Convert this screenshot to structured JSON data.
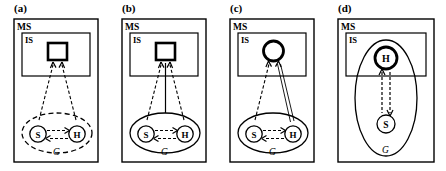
{
  "figure": {
    "width": 446,
    "height": 171,
    "background": "#ffffff",
    "stroke_color": "#000000",
    "panel_count": 4
  },
  "panels": [
    {
      "id": "panel-a",
      "label": "(a)",
      "outer_box_label": "MS",
      "inner_box_label": "IS",
      "group_label": "G",
      "node_left_label": "S",
      "node_right_label": "H",
      "percept_shape": "square",
      "percept_stroke": "thick",
      "group_ellipse_style": "dashed",
      "node_left_circle_style": "thin",
      "node_right_circle_style": "thin",
      "arrow_left_to_percept": "dashed-single",
      "arrow_right_to_percept": "dashed-single",
      "arrow_center_to_percept": "none",
      "arrow_s_to_h": "dashed-single",
      "arrow_h_to_s": "dashed-single"
    },
    {
      "id": "panel-b",
      "label": "(b)",
      "outer_box_label": "MS",
      "inner_box_label": "IS",
      "group_label": "G",
      "node_left_label": "S",
      "node_right_label": "H",
      "percept_shape": "square",
      "percept_stroke": "thick",
      "group_ellipse_style": "solid",
      "node_left_circle_style": "thin",
      "node_right_circle_style": "thin",
      "arrow_left_to_percept": "dashed-single",
      "arrow_right_to_percept": "dashed-single",
      "arrow_center_to_percept": "solid-line",
      "arrow_s_to_h": "dashed-single",
      "arrow_h_to_s": "dashed-single"
    },
    {
      "id": "panel-c",
      "label": "(c)",
      "outer_box_label": "MS",
      "inner_box_label": "IS",
      "group_label": "G",
      "node_left_label": "S",
      "node_right_label": "H",
      "percept_shape": "circle",
      "percept_stroke": "thick",
      "group_ellipse_style": "solid",
      "node_left_circle_style": "thin",
      "node_right_circle_style": "thin",
      "arrow_left_to_percept": "dashed-single",
      "arrow_right_to_percept": "solid-double",
      "arrow_center_to_percept": "none",
      "arrow_s_to_h": "dashed-single",
      "arrow_h_to_s": "dashed-single"
    },
    {
      "id": "panel-d",
      "label": "(d)",
      "outer_box_label": "MS",
      "inner_box_label": "IS",
      "group_label": "G",
      "node_top_label": "H",
      "node_bottom_label": "S",
      "percept_shape": "none",
      "node_top_circle_style": "thick",
      "node_bottom_circle_style": "thin",
      "group_ellipse_style": "solid-vertical",
      "arrow_up_h": "dashed-single",
      "arrow_down_s": "dashed-single"
    }
  ]
}
